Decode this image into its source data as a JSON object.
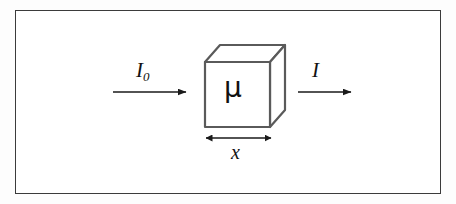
{
  "figure": {
    "frame": {
      "border_color": "#3b3b3b",
      "background_color": "#ffffff"
    },
    "page_background": "#fdfdfd",
    "line_color": "#555555",
    "arrow_color": "#1a1a1a",
    "text_color": "#111111",
    "labels": {
      "incident_intensity": "I",
      "incident_intensity_subscript": "0",
      "transmitted_intensity": "I",
      "attenuation_coefficient": "μ",
      "thickness": "x"
    },
    "elements": {
      "incident_arrow": "incident-beam-arrow",
      "transmitted_arrow": "transmitted-beam-arrow",
      "thickness_arrow": "thickness-dimension-arrow",
      "absorber": "absorber-cube"
    },
    "cube_geometry": {
      "front_face": "205,62 270,62 270,127 205,127",
      "top_face": "205,62 220,45 285,45 270,62",
      "right_face": "270,62 285,45 285,110 270,127"
    }
  }
}
